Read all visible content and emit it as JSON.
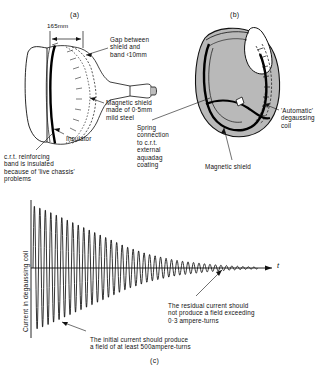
{
  "figure": {
    "panels": [
      {
        "tag": "(a)",
        "x": 70,
        "y": 11
      },
      {
        "tag": "(b)",
        "x": 230,
        "y": 11
      },
      {
        "tag": "(c)",
        "x": 150,
        "y": 357
      }
    ]
  },
  "panel_a": {
    "dimension_label": "165mm",
    "callouts": [
      {
        "name": "gap-callout",
        "text": "Gap between\nshield and\nband ‹10mm",
        "x": 110,
        "y": 36
      },
      {
        "name": "magnetic-shield-callout",
        "text": "Magnetic shield\nmade of 0·5mm\nmild steel",
        "x": 106,
        "y": 99
      },
      {
        "name": "insulator-callout",
        "text": "Insulator",
        "x": 66,
        "y": 135
      },
      {
        "name": "reinforcing-band-callout",
        "text": "c.r.t. reinforcing\nband is insulated\nbecause of 'live chassis'\nproblems",
        "x": 4,
        "y": 153
      }
    ]
  },
  "panel_b": {
    "callouts": [
      {
        "name": "automatic-degaussing-coil-callout",
        "text": "'Automatic'\ndegaussing\ncoil",
        "x": 281,
        "y": 107
      },
      {
        "name": "spring-connection-callout",
        "text": "Spring\nconnection\nto c.r.t.\nexternal\naquadag\ncoating",
        "x": 137,
        "y": 124
      },
      {
        "name": "magnetic-shield-b-callout",
        "text": "Magnetic shield",
        "x": 205,
        "y": 163
      }
    ]
  },
  "chart_data": {
    "type": "line",
    "title": "",
    "xlabel": "t",
    "ylabel": "Current in degaussing coil",
    "x": [
      0,
      1,
      2,
      3,
      4,
      5,
      6,
      7,
      8,
      9,
      10,
      11,
      12,
      13,
      14,
      15,
      16,
      17,
      18,
      19,
      20,
      21,
      22,
      23,
      24,
      25,
      26,
      27,
      28,
      29,
      30,
      31,
      32,
      33,
      34,
      35,
      36,
      37,
      38,
      39,
      40
    ],
    "envelope": [
      100,
      97,
      94,
      90,
      86,
      82,
      78,
      74,
      70,
      66,
      62,
      58,
      54,
      50,
      46,
      42,
      38,
      34,
      31,
      28,
      25,
      22,
      20,
      18,
      16,
      14,
      12.5,
      11,
      10,
      9,
      8,
      7,
      6,
      5.3,
      4.6,
      4,
      3.4,
      2.9,
      2.4,
      2,
      1.6
    ],
    "cycles": 40,
    "decay_type": "exponential-envelope",
    "grid": false,
    "legend": false,
    "axis_origin_label": "",
    "annotations": [
      {
        "name": "residual-current-annotation",
        "text": "The residual current should\nnot produce a field exceeding\n0·3 ampere-turns",
        "x": 168,
        "y": 302
      },
      {
        "name": "initial-current-annotation",
        "text": "The initial current should produce\na field of at least 500ampere-turns",
        "x": 90,
        "y": 336
      }
    ]
  },
  "colors": {
    "ink": "#111111",
    "shield_fill": "#b9b9b9",
    "glass_fill": "#ffffff",
    "coil_stroke": "#000000"
  }
}
